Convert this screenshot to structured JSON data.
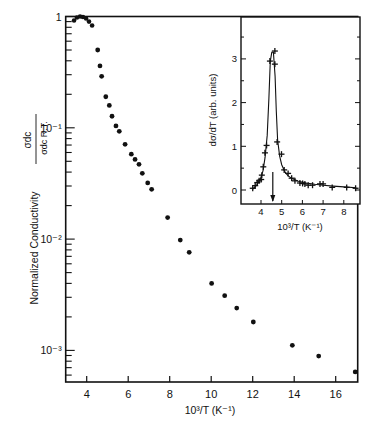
{
  "chart_data": [
    {
      "type": "scatter",
      "title": "",
      "xlabel": "10³/T (K⁻¹)",
      "ylabel": "Normalized Conductivity  σdc / σdc R.T.",
      "xscale": "linear",
      "yscale": "log",
      "xlim": [
        3,
        17
      ],
      "ylim": [
        0.00052,
        1
      ],
      "grid": false,
      "legend": null,
      "x_ticks": [
        4,
        6,
        8,
        10,
        12,
        14,
        16
      ],
      "x_tick_labels": [
        "4",
        "6",
        "8",
        "10",
        "12",
        "14",
        "16"
      ],
      "y_ticks": [
        1,
        0.1,
        0.01,
        0.001
      ],
      "y_tick_labels": [
        "1",
        "10⁻¹",
        "10⁻²",
        "10⁻³"
      ],
      "series": [
        {
          "name": "normalized dc conductivity",
          "marker": "filled-circle",
          "x": [
            3.39,
            3.53,
            3.68,
            3.82,
            3.97,
            4.11,
            4.26,
            4.53,
            4.64,
            4.72,
            4.92,
            5.09,
            5.22,
            5.41,
            5.57,
            5.85,
            6.15,
            6.33,
            6.52,
            6.68,
            6.94,
            7.13,
            7.9,
            8.51,
            8.94,
            10.02,
            10.65,
            11.23,
            12.03,
            13.91,
            15.18,
            16.94
          ],
          "y": [
            0.92,
            0.98,
            1.0,
            0.99,
            0.96,
            0.9,
            0.83,
            0.5,
            0.36,
            0.29,
            0.19,
            0.159,
            0.127,
            0.104,
            0.093,
            0.071,
            0.058,
            0.052,
            0.047,
            0.039,
            0.032,
            0.028,
            0.0156,
            0.0098,
            0.0076,
            0.004,
            0.0031,
            0.0024,
            0.0018,
            0.00111,
            0.00089,
            0.00064
          ]
        }
      ]
    },
    {
      "type": "line",
      "title": "inset",
      "xlabel": "10³/T (K⁻¹)",
      "ylabel": "dσ/dT (arb. units)",
      "xlim": [
        3,
        8.8
      ],
      "ylim": [
        -0.3,
        3.9
      ],
      "grid": false,
      "x_ticks": [
        4,
        5,
        6,
        7,
        8
      ],
      "x_tick_labels": [
        "4",
        "5",
        "6",
        "7",
        "8"
      ],
      "y_ticks": [
        0,
        1,
        2,
        3
      ],
      "y_tick_labels": [
        "0",
        "1",
        "2",
        "3"
      ],
      "annotations": [
        {
          "type": "arrow-down",
          "x": 4.57,
          "text": ""
        }
      ],
      "series": [
        {
          "name": "dσ/dT data",
          "marker": "plus",
          "x": [
            3.6,
            3.72,
            3.82,
            3.91,
            4.01,
            4.04,
            4.11,
            4.19,
            4.27,
            4.43,
            4.67,
            4.67,
            4.78,
            4.99,
            5.12,
            5.31,
            5.48,
            5.64,
            5.88,
            6.01,
            6.12,
            6.28,
            6.49,
            6.85,
            7.0,
            7.44,
            8.14,
            8.57
          ],
          "y": [
            0.04,
            0.1,
            0.17,
            0.21,
            0.24,
            0.34,
            0.53,
            0.85,
            1.02,
            2.95,
            3.18,
            2.88,
            1.1,
            0.82,
            0.46,
            0.38,
            0.27,
            0.21,
            0.16,
            0.15,
            0.14,
            0.11,
            0.11,
            0.14,
            0.14,
            0.06,
            0.06,
            0.04
          ]
        },
        {
          "name": "fit curve",
          "marker": "none",
          "x": [
            3.6,
            3.8,
            4.0,
            4.1,
            4.2,
            4.3,
            4.38,
            4.45,
            4.52,
            4.6,
            4.68,
            4.74,
            4.8,
            4.9,
            5.0,
            5.15,
            5.3,
            5.5,
            5.8,
            6.2,
            6.6,
            7.0,
            7.5,
            8.0,
            8.6
          ],
          "y": [
            0.02,
            0.12,
            0.28,
            0.45,
            0.75,
            1.25,
            2.1,
            2.95,
            3.15,
            3.15,
            2.6,
            1.8,
            1.15,
            0.78,
            0.58,
            0.42,
            0.33,
            0.26,
            0.2,
            0.16,
            0.13,
            0.11,
            0.09,
            0.07,
            0.05
          ]
        }
      ]
    }
  ],
  "main": {
    "x_axis_label": "10³/T  (K⁻¹)",
    "y_axis_label_text": "Normalized  Conductivity",
    "y_axis_fraction_num": "σdc",
    "y_axis_fraction_den": "σdc R.T."
  },
  "inset": {
    "x_axis_label": "10³/T  (K⁻¹)",
    "y_axis_label": "dσ/dT (arb. units)"
  }
}
